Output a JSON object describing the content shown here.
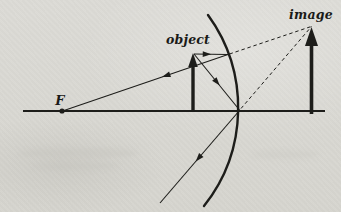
{
  "figure": {
    "type": "ray-diagram",
    "labels": {
      "focal_point": "F",
      "object": "object",
      "image": "image"
    },
    "colors": {
      "ink": "#1d1d1a",
      "paper": "#dbdad5",
      "label": "#1a1a17"
    },
    "geometry": {
      "viewbox": "0 0 341 212",
      "axis": {
        "name": "principal-axis",
        "x1": 23,
        "y1": 111,
        "x2": 325,
        "y2": 111,
        "w": 1.8
      },
      "mirror": {
        "name": "mirror-arc",
        "path": "M 208 15 A 158 158 0 0 1 204 206",
        "w": 2.4
      },
      "focal_dot": {
        "name": "focal-point-dot",
        "cx": 62,
        "cy": 111,
        "r": 2.6
      },
      "thick_arrows": [
        {
          "name": "object-arrow",
          "x": 193,
          "base": 112,
          "tip": 53,
          "shaft_w": 3.4,
          "head_w": 9.5,
          "head_len": 14
        },
        {
          "name": "image-arrow",
          "x": 311.5,
          "base": 114,
          "tip": 27,
          "shaft_w": 3.6,
          "head_w": 13,
          "head_len": 19
        }
      ],
      "rays": [
        {
          "name": "incident-ray-parallel-to-axis",
          "x1": 194,
          "y1": 54,
          "x2": 228,
          "y2": 54.5,
          "dashed": false,
          "arrow": {
            "x": 207,
            "y": 54.2,
            "angle": 1
          }
        },
        {
          "name": "reflected-ray-through-focus",
          "x1": 228,
          "y1": 54.5,
          "x2": 64,
          "y2": 110.5,
          "dashed": false,
          "arrow": {
            "x": 166,
            "y": 75.7,
            "angle": 161.2
          }
        },
        {
          "name": "incident-ray-to-pole",
          "x1": 194,
          "y1": 54,
          "x2": 239.5,
          "y2": 110,
          "dashed": false,
          "arrow": {
            "x": 217,
            "y": 82.3,
            "angle": 50.9
          }
        },
        {
          "name": "reflected-ray-below-axis",
          "x1": 239.5,
          "y1": 110.5,
          "x2": 160,
          "y2": 203,
          "dashed": false,
          "arrow": {
            "x": 198.5,
            "y": 158.2,
            "angle": 130.7
          }
        },
        {
          "name": "virtual-ray-extension-upper",
          "x1": 229.5,
          "y1": 54,
          "x2": 311.2,
          "y2": 26.5,
          "dashed": true,
          "arrow": null
        },
        {
          "name": "virtual-ray-extension-lower",
          "x1": 241,
          "y1": 108.5,
          "x2": 311.5,
          "y2": 26.5,
          "dashed": true,
          "arrow": null
        }
      ]
    }
  }
}
